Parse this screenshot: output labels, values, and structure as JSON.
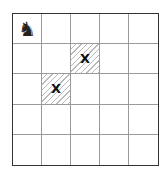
{
  "board": {
    "rows": 5,
    "cols": 5,
    "pieces": [
      {
        "row": 0,
        "col": 0,
        "type": "knight",
        "glyph": "♞"
      }
    ],
    "marked_cells": [
      {
        "row": 1,
        "col": 2,
        "label": "X",
        "hatched": true
      },
      {
        "row": 2,
        "col": 1,
        "label": "X",
        "hatched": true
      }
    ]
  },
  "cells": {
    "r0c0": "♞",
    "r1c2": "X",
    "r2c1": "X"
  }
}
